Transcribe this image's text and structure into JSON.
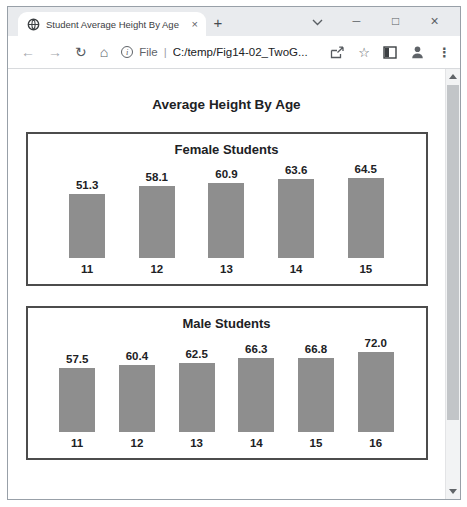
{
  "browser": {
    "tab_title": "Student Average Height By Age",
    "icons": {
      "tab_close": "×",
      "new_tab": "+",
      "minimize": "─",
      "maximize": "□",
      "window_close": "×",
      "back": "←",
      "forward": "→",
      "reload": "↻",
      "home": "⌂",
      "info": "i",
      "bookmark_star": "☆",
      "menu_dots": "⋮"
    },
    "toolbar": {
      "url_scheme": "File",
      "url_divider": "|",
      "url_path": "C:/temp/Fig14-02_TwoG..."
    }
  },
  "page": {
    "title": "Average Height By Age"
  },
  "colors": {
    "bar": "#8e8e8e",
    "chart_border": "#4c4c4c"
  },
  "chart_data": [
    {
      "type": "bar",
      "title": "Female Students",
      "categories": [
        "11",
        "12",
        "13",
        "14",
        "15"
      ],
      "values": [
        51.3,
        58.1,
        60.9,
        63.6,
        64.5
      ],
      "value_labels": [
        "51.3",
        "58.1",
        "60.9",
        "63.6",
        "64.5"
      ],
      "bar_color": "#8e8e8e",
      "baseline": 0,
      "value_label_position": "above",
      "grid": false,
      "legend": false
    },
    {
      "type": "bar",
      "title": "Male Students",
      "categories": [
        "11",
        "12",
        "13",
        "14",
        "15",
        "16"
      ],
      "values": [
        57.5,
        60.4,
        62.5,
        66.3,
        66.8,
        72.0
      ],
      "value_labels": [
        "57.5",
        "60.4",
        "62.5",
        "66.3",
        "66.8",
        "72.0"
      ],
      "bar_color": "#8e8e8e",
      "baseline": 0,
      "value_label_position": "above",
      "grid": false,
      "legend": false
    }
  ]
}
